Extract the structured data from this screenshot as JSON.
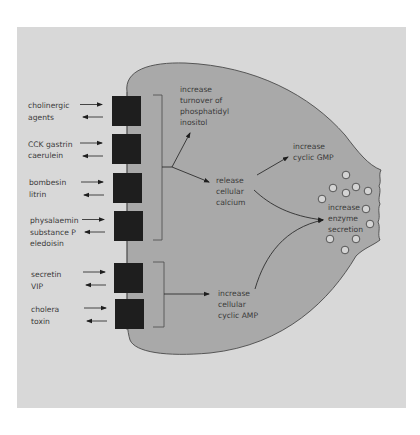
{
  "colors": {
    "page_background": "#ffffff",
    "frame_background": "#d8d8d8",
    "cell_fill": "#a9a9a9",
    "cell_outline": "#4a4a4a",
    "receptor_fill": "#1e1e1e",
    "text": "#3a3a3a",
    "granule_fill": "#d4d4d4"
  },
  "receptors": [
    {
      "lines": [
        "cholinergic",
        "agents"
      ]
    },
    {
      "lines": [
        "CCK gastrin",
        "caerulein"
      ]
    },
    {
      "lines": [
        "bombesin",
        "litrin"
      ]
    },
    {
      "lines": [
        "physalaemin",
        "substance P",
        "eledoisin"
      ]
    },
    {
      "lines": [
        "secretin",
        "VIP"
      ]
    },
    {
      "lines": [
        "cholera",
        "toxin"
      ]
    }
  ],
  "pathways": {
    "phosphatidyl": [
      "increase",
      "turnover of",
      "phosphatidyl",
      "inositol"
    ],
    "calcium": [
      "release",
      "cellular",
      "calcium"
    ],
    "cgmp": [
      "increase",
      "cyclic GMP"
    ],
    "camp": [
      "increase",
      "cellular",
      "cyclic AMP"
    ],
    "enzyme": [
      "increase",
      "enzyme",
      "secretion"
    ]
  },
  "icons": {
    "arrow_in": "arrow-right-icon",
    "arrow_out": "arrow-left-icon",
    "granule": "circle-icon"
  }
}
